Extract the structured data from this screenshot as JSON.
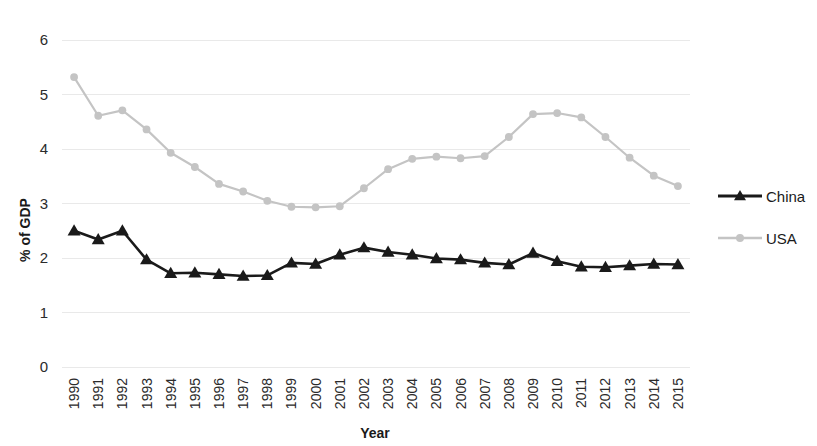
{
  "chart_data": {
    "type": "line",
    "title": "",
    "xlabel": "Year",
    "ylabel": "% of GDP",
    "x": [
      1990,
      1991,
      1992,
      1993,
      1994,
      1995,
      1996,
      1997,
      1998,
      1999,
      2000,
      2001,
      2002,
      2003,
      2004,
      2005,
      2006,
      2007,
      2008,
      2009,
      2010,
      2011,
      2012,
      2013,
      2014,
      2015
    ],
    "categories": [
      "1990",
      "1991",
      "1992",
      "1993",
      "1994",
      "1995",
      "1996",
      "1997",
      "1998",
      "1999",
      "2000",
      "2001",
      "2002",
      "2003",
      "2004",
      "2005",
      "2006",
      "2007",
      "2008",
      "2009",
      "2010",
      "2011",
      "2012",
      "2013",
      "2014",
      "2015"
    ],
    "series": [
      {
        "name": "China",
        "color": "#1a1a1a",
        "marker": "triangle",
        "values": [
          2.5,
          2.34,
          2.5,
          1.97,
          1.72,
          1.73,
          1.7,
          1.67,
          1.68,
          1.91,
          1.89,
          2.06,
          2.19,
          2.11,
          2.06,
          1.99,
          1.97,
          1.91,
          1.88,
          2.09,
          1.94,
          1.84,
          1.83,
          1.86,
          1.89,
          1.88
        ]
      },
      {
        "name": "USA",
        "color": "#c4c4c4",
        "marker": "circle",
        "values": [
          5.32,
          4.61,
          4.71,
          4.36,
          3.93,
          3.67,
          3.36,
          3.22,
          3.05,
          2.94,
          2.93,
          2.95,
          3.28,
          3.63,
          3.82,
          3.86,
          3.83,
          3.87,
          4.22,
          4.64,
          4.66,
          4.58,
          4.22,
          3.84,
          3.51,
          3.32
        ]
      }
    ],
    "ylim": [
      0,
      6
    ],
    "yticks": [
      0,
      1,
      2,
      3,
      4,
      5,
      6
    ],
    "ytick_labels": [
      "0",
      "1",
      "2",
      "3",
      "4",
      "5",
      "6"
    ],
    "grid": true,
    "legend_position": "right"
  },
  "legend": {
    "items": [
      {
        "label": "China"
      },
      {
        "label": "USA"
      }
    ]
  },
  "colors": {
    "china": "#1a1a1a",
    "usa": "#c4c4c4",
    "grid": "#e9e9e9",
    "text": "#1a1a1a",
    "background": "#ffffff"
  }
}
